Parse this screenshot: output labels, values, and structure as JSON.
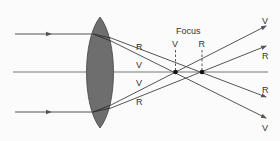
{
  "diagram": {
    "title_label": "Focus",
    "ray_labels": {
      "red": "R",
      "violet": "V"
    },
    "colors": {
      "background": "#fbfbfb",
      "lens": "#6e6e6e",
      "line": "#555555",
      "text": "#333333"
    },
    "labels": [
      {
        "id": "upper-r-left",
        "text": "R"
      },
      {
        "id": "upper-v-left",
        "text": "V"
      },
      {
        "id": "lower-v-left",
        "text": "V"
      },
      {
        "id": "lower-r-left",
        "text": "R"
      },
      {
        "id": "focus-v",
        "text": "V"
      },
      {
        "id": "focus-r",
        "text": "R"
      },
      {
        "id": "right-v-top",
        "text": "V"
      },
      {
        "id": "right-r-upper",
        "text": "R"
      },
      {
        "id": "right-r-lower",
        "text": "R"
      },
      {
        "id": "right-v-bottom",
        "text": "V"
      }
    ]
  }
}
